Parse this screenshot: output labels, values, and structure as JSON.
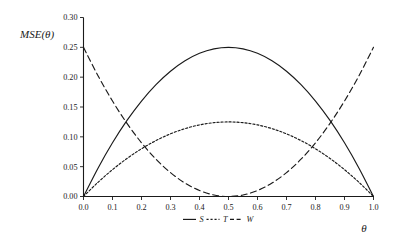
{
  "chart_data": {
    "type": "line",
    "title": "",
    "xlabel": "θ",
    "ylabel": "MSE(θ)",
    "xlim": [
      0.0,
      1.0
    ],
    "ylim": [
      0.0,
      0.3
    ],
    "grid": false,
    "legend_position": "bottom-center",
    "x_ticks": [
      "0.0",
      "0.1",
      "0.2",
      "0.3",
      "0.4",
      "0.5",
      "0.6",
      "0.7",
      "0.8",
      "0.9",
      "1.0"
    ],
    "x_tick_values": [
      0.0,
      0.1,
      0.2,
      0.3,
      0.4,
      0.5,
      0.6,
      0.7,
      0.8,
      0.9,
      1.0
    ],
    "y_ticks": [
      "0.00",
      "0.05",
      "0.10",
      "0.15",
      "0.20",
      "0.25",
      "0.30"
    ],
    "y_tick_values": [
      0.0,
      0.05,
      0.1,
      0.15,
      0.2,
      0.25,
      0.3
    ],
    "x": [
      0.0,
      0.05,
      0.1,
      0.15,
      0.2,
      0.25,
      0.3,
      0.35,
      0.4,
      0.45,
      0.5,
      0.55,
      0.6,
      0.65,
      0.7,
      0.75,
      0.8,
      0.85,
      0.9,
      0.95,
      1.0
    ],
    "series": [
      {
        "name": "S",
        "style": "solid",
        "values": [
          0.0,
          0.0475,
          0.09,
          0.1275,
          0.16,
          0.1875,
          0.21,
          0.2275,
          0.24,
          0.2475,
          0.25,
          0.2475,
          0.24,
          0.2275,
          0.21,
          0.1875,
          0.16,
          0.1275,
          0.09,
          0.0475,
          0.0
        ]
      },
      {
        "name": "T",
        "style": "dotted",
        "values": [
          0.0,
          0.02375,
          0.045,
          0.06375,
          0.08,
          0.09375,
          0.105,
          0.11375,
          0.12,
          0.12375,
          0.125,
          0.12375,
          0.12,
          0.11375,
          0.105,
          0.09375,
          0.08,
          0.06375,
          0.045,
          0.02375,
          0.0
        ]
      },
      {
        "name": "W",
        "style": "dashed",
        "values": [
          0.25,
          0.2025,
          0.16,
          0.1225,
          0.09,
          0.0625,
          0.04,
          0.0225,
          0.01,
          0.0025,
          0.0,
          0.0025,
          0.01,
          0.0225,
          0.04,
          0.0625,
          0.09,
          0.1225,
          0.16,
          0.2025,
          0.25
        ]
      }
    ],
    "legend": [
      {
        "label": "S",
        "style": "solid"
      },
      {
        "label": "T",
        "style": "dotted"
      },
      {
        "label": "W",
        "style": "dashed"
      }
    ]
  }
}
